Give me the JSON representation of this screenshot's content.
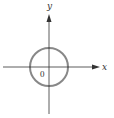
{
  "diagram": {
    "type": "coordinate-plane-with-circle",
    "axes": {
      "x_label": "x",
      "y_label": "y",
      "origin_label": "0",
      "color": "#333333"
    },
    "circle": {
      "center": "origin",
      "stroke_color": "#888888"
    }
  }
}
